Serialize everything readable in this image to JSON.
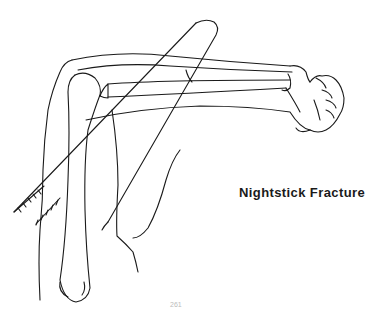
{
  "figure": {
    "caption": "Nightstick Fracture",
    "page_number": "261",
    "line_color": "#1a1a1a",
    "background": "#ffffff"
  }
}
